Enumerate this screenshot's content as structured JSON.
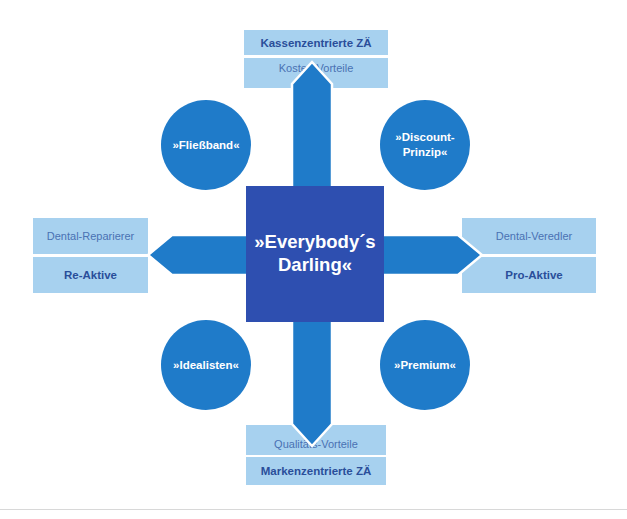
{
  "diagram": {
    "center": {
      "line1": "»Everybody´s",
      "line2": "Darling«"
    },
    "top": {
      "title": "Kassenzentrierte ZÄ",
      "subtitle": "Kosten-Vorteile"
    },
    "bottom": {
      "subtitle": "Qualitäts-Vorteile",
      "title": "Markenzentrierte ZÄ"
    },
    "left": {
      "subtitle": "Dental-Reparierer",
      "title": "Re-Aktive"
    },
    "right": {
      "subtitle": "Dental-Veredler",
      "title": "Pro-Aktive"
    },
    "quadrants": {
      "top_left": "»Fließband«",
      "top_right_line1": "»Discount-",
      "top_right_line2": "Prinzip«",
      "bottom_left": "»Idealisten«",
      "bottom_right": "»Premium«"
    },
    "colors": {
      "center_square": "#2e4fb0",
      "arrows": "#1f7bc9",
      "circles": "#1f7bc9",
      "label_boxes": "#a7d1ef",
      "bold_label_text": "#2a4e9a",
      "light_label_text": "#4a72b3"
    }
  }
}
